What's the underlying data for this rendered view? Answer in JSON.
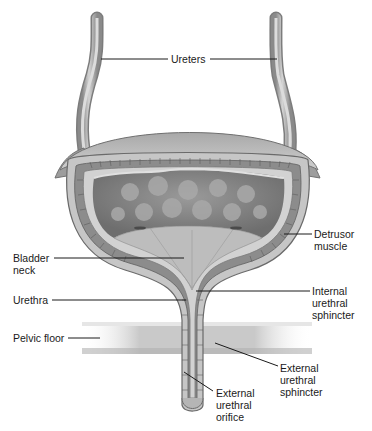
{
  "diagram": {
    "colors": {
      "background": "#ffffff",
      "tissue_outer": "#b8b8b8",
      "tissue_light": "#d6d6d6",
      "muscle_band": "#8e8e8e",
      "lumen_dark": "#7a7a7a",
      "lumen_spots": "#a6a6a6",
      "leader_line": "#1a1a1a",
      "text": "#1a1a1a"
    },
    "labels": {
      "ureters": "Ureters",
      "detrusor_muscle": "Detrusor\nmuscle",
      "bladder_neck": "Bladder\nneck",
      "urethra": "Urethra",
      "internal_urethral_sphincter": "Internal\nurethral\nsphincter",
      "pelvic_floor": "Pelvic floor",
      "external_urethral_sphincter": "External\nurethral\nsphincter",
      "external_urethral_orifice": "External\nurethral\norifice"
    }
  }
}
